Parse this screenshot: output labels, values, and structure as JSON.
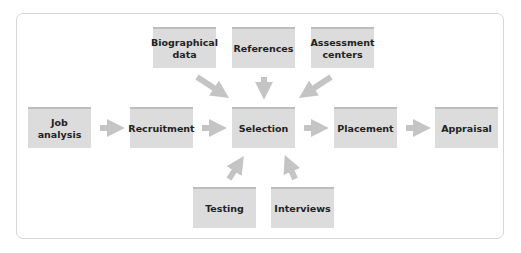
{
  "diagram": {
    "colors": {
      "box_fill": "#dcdcdc",
      "box_top": "#bdbdbd",
      "arrow": "#c4c4c4",
      "frame": "#d6d6d6",
      "text": "#222222"
    },
    "top_inputs": [
      {
        "id": "biographical",
        "label": "Biographical\ndata"
      },
      {
        "id": "references",
        "label": "References"
      },
      {
        "id": "assessment",
        "label": "Assessment\ncenters"
      }
    ],
    "main_flow": [
      {
        "id": "job",
        "label": "Job\nanalysis"
      },
      {
        "id": "recruitment",
        "label": "Recruitment"
      },
      {
        "id": "selection",
        "label": "Selection"
      },
      {
        "id": "placement",
        "label": "Placement"
      },
      {
        "id": "appraisal",
        "label": "Appraisal"
      }
    ],
    "bottom_inputs": [
      {
        "id": "testing",
        "label": "Testing"
      },
      {
        "id": "interviews",
        "label": "Interviews"
      }
    ]
  }
}
